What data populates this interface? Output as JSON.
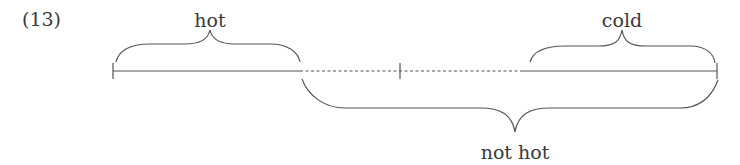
{
  "example_number": "(13)",
  "labels": {
    "hot": "hot",
    "cold": "cold",
    "not_hot": "not hot"
  },
  "scale": {
    "segments": [
      {
        "name": "hot-region",
        "style": "solid"
      },
      {
        "name": "middle-region",
        "style": "dashed"
      },
      {
        "name": "cold-region",
        "style": "solid"
      }
    ],
    "ticks": [
      "left-end",
      "midpoint",
      "right-end"
    ]
  },
  "colors": {
    "line": "#555555",
    "text": "#3a3a3a"
  }
}
